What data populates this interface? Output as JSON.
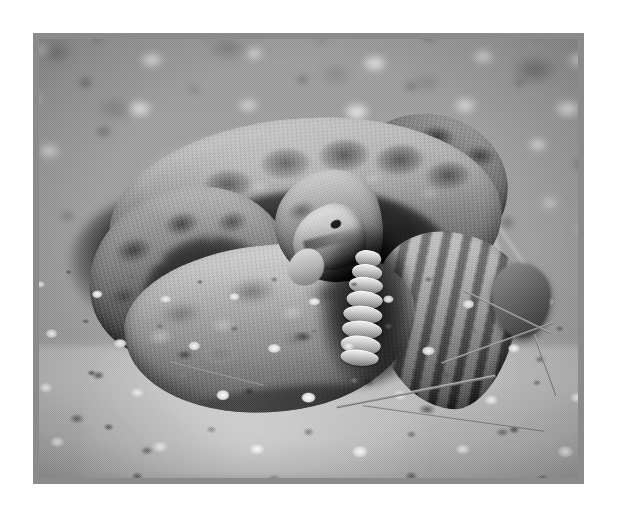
{
  "page": {
    "background_color": "#ffffff",
    "width": 618,
    "height": 514
  },
  "frame": {
    "border_color": "#8b8b8b",
    "border_width_px": 6,
    "left": 33,
    "top": 33,
    "width": 551,
    "height": 451
  },
  "photograph": {
    "name": "coiled-rattlesnake-photo",
    "alt_text": "Black and white photograph of a coiled rattlesnake on desert gravel",
    "color_mode": "black-and-white",
    "subject": "rattlesnake",
    "setting": "desert gravel ground",
    "tones": {
      "background_midtone": "#9d9d9d",
      "foreground_gravel_light": "#f0f0f0",
      "deep_shadow": "#1a1a1a",
      "snake_body_light": "#c4c0ba",
      "snake_body_dark": "#4f4c48"
    },
    "elements": [
      {
        "name": "snake-outer-coil",
        "label": "Outer body coil"
      },
      {
        "name": "snake-left-coil",
        "label": "Left body arc"
      },
      {
        "name": "snake-front-coil",
        "label": "Sunlit front coil"
      },
      {
        "name": "snake-right-coil",
        "label": "Upper right tight coil"
      },
      {
        "name": "snake-tail-body",
        "label": "Banded tail body"
      },
      {
        "name": "snake-neck",
        "label": "Raised neck"
      },
      {
        "name": "snake-head",
        "label": "Wedge-shaped head"
      },
      {
        "name": "snake-eye",
        "label": "Eye"
      },
      {
        "name": "snake-rattle",
        "label": "Rattle (8 segments)"
      },
      {
        "name": "ground-gravel",
        "label": "Gravel ground"
      },
      {
        "name": "background-blur",
        "label": "Out-of-focus background"
      },
      {
        "name": "twigs",
        "label": "Dry twigs"
      },
      {
        "name": "right-stone",
        "label": "Dark stone at right"
      }
    ],
    "rattle_segment_count": 8
  },
  "caption": {
    "text": ""
  }
}
